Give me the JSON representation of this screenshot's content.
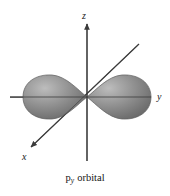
{
  "figure": {
    "caption_symbol": "p",
    "caption_subscript": "y",
    "caption_text": "orbital",
    "caption_full": "py orbital",
    "background_color": "#ffffff"
  },
  "axes": {
    "z": {
      "label": "z",
      "orientation": "vertical-up",
      "has_arrow": true
    },
    "y": {
      "label": "y",
      "orientation": "horizontal-right",
      "has_arrow": true
    },
    "x": {
      "label": "x",
      "orientation": "diagonal-lower-left",
      "has_arrow": true
    },
    "line_color": "#3b3b3b"
  },
  "orbital": {
    "type": "p-orbital",
    "axis": "y",
    "lobe_count": 2,
    "lobe_fill_dark": "#6f6f6f",
    "lobe_fill_mid": "#8a8a8a",
    "lobe_highlight": "#b4b4b4",
    "lobe_edge": "#5a5a5a",
    "left_lobe_name": "left-lobe",
    "right_lobe_name": "right-lobe"
  }
}
